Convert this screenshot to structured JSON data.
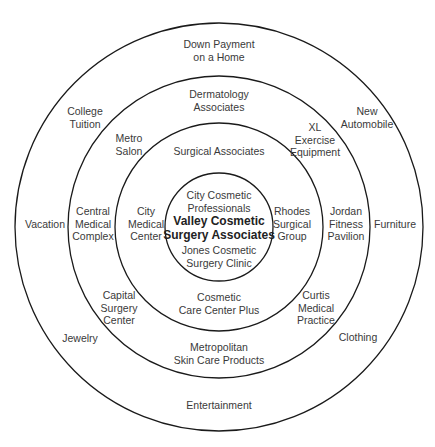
{
  "diagram": {
    "type": "concentric-circles",
    "center": {
      "x": 219,
      "y": 227
    },
    "line_color": "#1a1a1a",
    "text_color": "#3a3a3a",
    "rings": [
      {
        "name": "outer",
        "radius": 204
      },
      {
        "name": "second",
        "radius": 151
      },
      {
        "name": "third",
        "radius": 104
      },
      {
        "name": "inner",
        "radius": 54
      }
    ],
    "center_label": {
      "lines": [
        "Valley Cosmetic",
        "Surgery Associates"
      ],
      "x": 219,
      "y": 228
    },
    "inner_ring": [
      {
        "lines": [
          "City Cosmetic",
          "Professionals"
        ],
        "x": 219,
        "y": 201
      },
      {
        "lines": [
          "Jones Cosmetic",
          "Surgery Clinic"
        ],
        "x": 219,
        "y": 256
      }
    ],
    "third_ring": [
      {
        "lines": [
          "Surgical Associates"
        ],
        "x": 219,
        "y": 151
      },
      {
        "lines": [
          "City",
          "Medical",
          "Center"
        ],
        "x": 146,
        "y": 224
      },
      {
        "lines": [
          "Rhodes",
          "Surgical",
          "Group"
        ],
        "x": 292,
        "y": 224
      },
      {
        "lines": [
          "Cosmetic",
          "Care Center Plus"
        ],
        "x": 219,
        "y": 303
      }
    ],
    "second_ring": [
      {
        "lines": [
          "Dermatology",
          "Associates"
        ],
        "x": 219,
        "y": 100
      },
      {
        "lines": [
          "Metro",
          "Salon"
        ],
        "x": 129,
        "y": 144
      },
      {
        "lines": [
          "XL",
          "Exercise",
          "Equipment"
        ],
        "x": 315,
        "y": 140
      },
      {
        "lines": [
          "Central",
          "Medical",
          "Complex"
        ],
        "x": 93,
        "y": 224
      },
      {
        "lines": [
          "Jordan",
          "Fitness",
          "Pavilion"
        ],
        "x": 346,
        "y": 224
      },
      {
        "lines": [
          "Capital",
          "Surgery",
          "Center"
        ],
        "x": 119,
        "y": 308
      },
      {
        "lines": [
          "Curtis",
          "Medical",
          "Practice"
        ],
        "x": 316,
        "y": 308
      },
      {
        "lines": [
          "Metropolitan",
          "Skin Care Products"
        ],
        "x": 219,
        "y": 353
      }
    ],
    "outer_ring": [
      {
        "lines": [
          "Down Payment",
          "on a Home"
        ],
        "x": 219,
        "y": 50
      },
      {
        "lines": [
          "College",
          "Tuition"
        ],
        "x": 85,
        "y": 117
      },
      {
        "lines": [
          "New",
          "Automobile"
        ],
        "x": 367,
        "y": 117
      },
      {
        "lines": [
          "Vacation"
        ],
        "x": 45,
        "y": 224
      },
      {
        "lines": [
          "Furniture"
        ],
        "x": 395,
        "y": 224
      },
      {
        "lines": [
          "Jewelry"
        ],
        "x": 80,
        "y": 338
      },
      {
        "lines": [
          "Clothing"
        ],
        "x": 358,
        "y": 337
      },
      {
        "lines": [
          "Entertainment"
        ],
        "x": 219,
        "y": 405
      }
    ]
  }
}
